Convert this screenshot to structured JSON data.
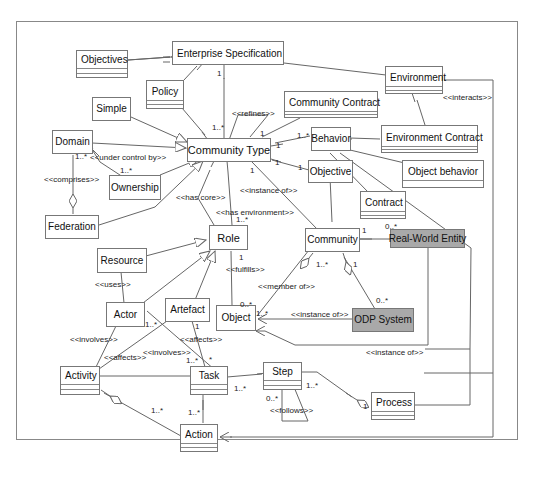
{
  "diagram": {
    "type": "UML class diagram",
    "classes": {
      "enterprise_specification": "Enterprise Specification",
      "objectives": "Objectives",
      "policy": "Policy",
      "environment": "Environment",
      "simple": "Simple",
      "community_contract": "Community Contract",
      "environment_contract": "Environment Contract",
      "domain": "Domain",
      "community_type": "Community Type",
      "behavior": "Behavior",
      "ownership": "Ownership",
      "objective": "Objective",
      "object_behavior": "Object behavior",
      "contract": "Contract",
      "federation": "Federation",
      "role": "Role",
      "community": "Community",
      "real_world_entity": "Real-World Entity",
      "resource": "Resource",
      "actor": "Actor",
      "artefact": "Artefact",
      "object": "Object",
      "odp_system": "ODP System",
      "activity": "Activity",
      "task": "Task",
      "step": "Step",
      "process": "Process",
      "action": "Action"
    },
    "stereotypes": {
      "interacts": "<<interacts>>",
      "refines": "<<refines>>",
      "under_control_by": "<<under control by>>",
      "comprises": "<<comprises>>",
      "instance_of_ct": "<<instance of>>",
      "has_core": "<<has core>>",
      "has_environment": "<<has environment>>",
      "fulfills": "<<fulfills>>",
      "uses": "<<uses>>",
      "member_of": "<<member of>>",
      "instance_of_odp": "<<instance of>>",
      "instance_of_rwe": "<<instance of>>",
      "involves_activity": "<<involves>>",
      "involves_task": "<<involves>>",
      "affects_activity": "<<affects>>",
      "affects_task": "<<affects>>",
      "follows": "<<follows>>"
    },
    "multiplicities": {
      "es_ct_1": "1",
      "es_ct_many": "1..*",
      "domain_many": "1..*",
      "ownership_many": "1..*",
      "ct_refines_1": "1",
      "ct_behavior_1": "1",
      "behavior_many": "1..*",
      "ct_obj_1a": "1",
      "ct_obj_1b": "1",
      "ct_community_1": "1",
      "role_many": "1..*",
      "role_1": "1",
      "community_rwe_1": "1",
      "rwe_many": "0..*",
      "community_member_many": "1..*",
      "community_odp_1": "1",
      "odp_many": "0..*",
      "object_many": "0..*",
      "object_inst_many": "1..*",
      "actor_many": "1..*",
      "artefact_1": "1",
      "task_involves_many": "1..*",
      "task_affects_star": "*",
      "task_step_many": "1..*",
      "step_follows_many": "0..*",
      "step_process_many": "1..*",
      "process_1": "1",
      "action_activity_many": "1..*",
      "action_task_many": "1..*"
    },
    "colors": {
      "line": "#666666",
      "shaded_fill": "#a9a9a9",
      "box_border": "#777777"
    }
  }
}
